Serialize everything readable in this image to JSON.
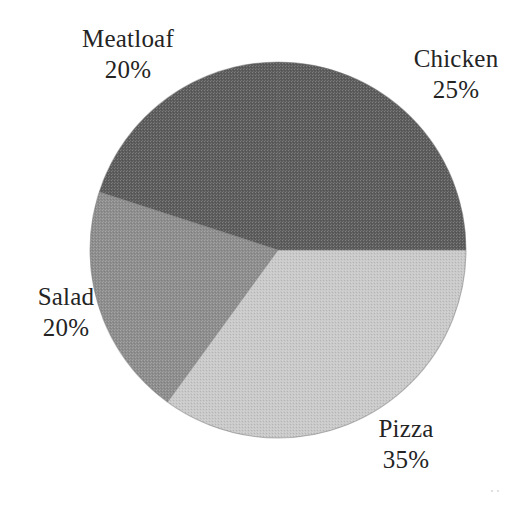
{
  "chart_data": {
    "type": "pie",
    "title": "",
    "subtitle": "",
    "xlabel": "",
    "ylabel": "",
    "legend_position": "none",
    "grid": false,
    "labels_outside": true,
    "units": "percent",
    "total": 100,
    "categories": [
      "Chicken",
      "Pizza",
      "Salad",
      "Meatloaf"
    ],
    "values": [
      25,
      35,
      20,
      20
    ],
    "start_angle_deg": 0,
    "direction": "clockwise",
    "slices": [
      {
        "name": "Chicken",
        "label": "Chicken",
        "value": 25,
        "value_text": "25%",
        "color": "#5c5c5c",
        "start_deg": 0,
        "end_deg": 90,
        "label_x": 456,
        "label_y": 60
      },
      {
        "name": "Pizza",
        "label": "Pizza",
        "value": 35,
        "value_text": "35%",
        "color": "#c9c9c9",
        "start_deg": 90,
        "end_deg": 216,
        "label_x": 406,
        "label_y": 430
      },
      {
        "name": "Salad",
        "label": "Salad",
        "value": 20,
        "value_text": "20%",
        "color": "#8d8d8d",
        "start_deg": 216,
        "end_deg": 288,
        "label_x": 66,
        "label_y": 298
      },
      {
        "name": "Meatloaf",
        "label": "Meatloaf",
        "value": 20,
        "value_text": "20%",
        "color": "#5c5c5c",
        "start_deg": 288,
        "end_deg": 360,
        "label_x": 128,
        "label_y": 40
      }
    ],
    "geometry": {
      "center_x": 278,
      "center_y": 250,
      "radius": 188
    },
    "colors": {
      "background": "#ffffff",
      "text": "#242424",
      "outline": "#6f6f6f",
      "chicken": "#5c5c5c",
      "pizza": "#c9c9c9",
      "salad": "#8d8d8d",
      "meatloaf": "#5c5c5c"
    }
  }
}
